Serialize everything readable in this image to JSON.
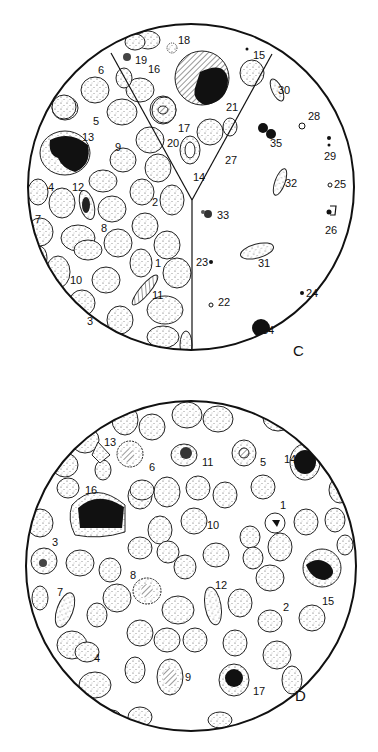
{
  "figure": {
    "panels": [
      {
        "id": "C",
        "label": "C",
        "description": "Circular microscope field divided into three sectors with numbered blood cell forms",
        "cell_labels": [
          {
            "n": "1",
            "x": 155,
            "y": 258
          },
          {
            "n": "2",
            "x": 152,
            "y": 197
          },
          {
            "n": "3",
            "x": 87,
            "y": 316
          },
          {
            "n": "4",
            "x": 48,
            "y": 182
          },
          {
            "n": "5",
            "x": 93,
            "y": 116
          },
          {
            "n": "6",
            "x": 98,
            "y": 65
          },
          {
            "n": "7",
            "x": 35,
            "y": 214
          },
          {
            "n": "8",
            "x": 101,
            "y": 223
          },
          {
            "n": "9",
            "x": 115,
            "y": 142
          },
          {
            "n": "10",
            "x": 70,
            "y": 275
          },
          {
            "n": "11",
            "x": 152,
            "y": 290
          },
          {
            "n": "12",
            "x": 72,
            "y": 182
          },
          {
            "n": "13",
            "x": 82,
            "y": 132
          },
          {
            "n": "14",
            "x": 193,
            "y": 172
          },
          {
            "n": "15",
            "x": 253,
            "y": 50
          },
          {
            "n": "16",
            "x": 148,
            "y": 64
          },
          {
            "n": "17",
            "x": 178,
            "y": 123
          },
          {
            "n": "18",
            "x": 178,
            "y": 35
          },
          {
            "n": "19",
            "x": 135,
            "y": 55
          },
          {
            "n": "20",
            "x": 167,
            "y": 138
          },
          {
            "n": "21",
            "x": 226,
            "y": 102
          },
          {
            "n": "22",
            "x": 218,
            "y": 297
          },
          {
            "n": "23",
            "x": 196,
            "y": 257
          },
          {
            "n": "24",
            "x": 306,
            "y": 288
          },
          {
            "n": "25",
            "x": 334,
            "y": 179
          },
          {
            "n": "26",
            "x": 325,
            "y": 225
          },
          {
            "n": "27",
            "x": 225,
            "y": 155
          },
          {
            "n": "28",
            "x": 308,
            "y": 111
          },
          {
            "n": "29",
            "x": 324,
            "y": 151
          },
          {
            "n": "30",
            "x": 278,
            "y": 85
          },
          {
            "n": "31",
            "x": 258,
            "y": 258
          },
          {
            "n": "32",
            "x": 285,
            "y": 178
          },
          {
            "n": "33",
            "x": 217,
            "y": 210
          },
          {
            "n": "34",
            "x": 262,
            "y": 325
          },
          {
            "n": "35",
            "x": 270,
            "y": 138
          }
        ]
      },
      {
        "id": "D",
        "label": "D",
        "description": "Circular microscope field with red blood cells and numbered abnormal cells",
        "cell_labels": [
          {
            "n": "1",
            "x": 280,
            "y": 500
          },
          {
            "n": "2",
            "x": 283,
            "y": 602
          },
          {
            "n": "3",
            "x": 52,
            "y": 537
          },
          {
            "n": "4",
            "x": 94,
            "y": 653
          },
          {
            "n": "5",
            "x": 260,
            "y": 457
          },
          {
            "n": "6",
            "x": 149,
            "y": 462
          },
          {
            "n": "7",
            "x": 57,
            "y": 587
          },
          {
            "n": "8",
            "x": 130,
            "y": 570
          },
          {
            "n": "9",
            "x": 185,
            "y": 672
          },
          {
            "n": "10",
            "x": 207,
            "y": 520
          },
          {
            "n": "11",
            "x": 202,
            "y": 457
          },
          {
            "n": "12",
            "x": 215,
            "y": 580
          },
          {
            "n": "13",
            "x": 104,
            "y": 437
          },
          {
            "n": "14",
            "x": 284,
            "y": 454
          },
          {
            "n": "15",
            "x": 322,
            "y": 596
          },
          {
            "n": "16",
            "x": 85,
            "y": 485
          },
          {
            "n": "17",
            "x": 253,
            "y": 686
          }
        ]
      }
    ]
  }
}
